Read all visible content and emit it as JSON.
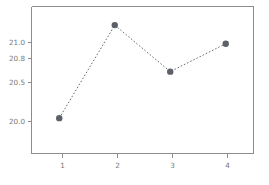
{
  "chart_data": {
    "type": "line",
    "title": "",
    "subtitle": "",
    "xlabel": "",
    "ylabel": "",
    "x": [
      1,
      2,
      3,
      4
    ],
    "categories": [
      "1",
      "2",
      "3",
      "4"
    ],
    "values": [
      20.0,
      21.0,
      20.5,
      20.8
    ],
    "series": [
      {
        "name": "",
        "values": [
          20.0,
          21.0,
          20.5,
          20.8
        ]
      }
    ],
    "xtick_labels": [
      "1",
      "2",
      "3",
      "4"
    ],
    "ytick_labels": [
      "21.0",
      "20.8",
      "20.5",
      "20.0"
    ],
    "ytick_values": [
      21.0,
      20.8,
      20.5,
      20.0
    ],
    "xlim": [
      0.5,
      4.5
    ],
    "ylim": [
      19.62,
      21.2
    ],
    "grid": false,
    "legend": false,
    "legend_position": "none",
    "line_style": "dotted",
    "marker": "circle",
    "colors": {
      "line": "#6b6f76",
      "marker": "#5c6068",
      "axis": "#8c8c8c",
      "tick_text": "#777777",
      "background": "#ffffff"
    },
    "annotations": []
  }
}
